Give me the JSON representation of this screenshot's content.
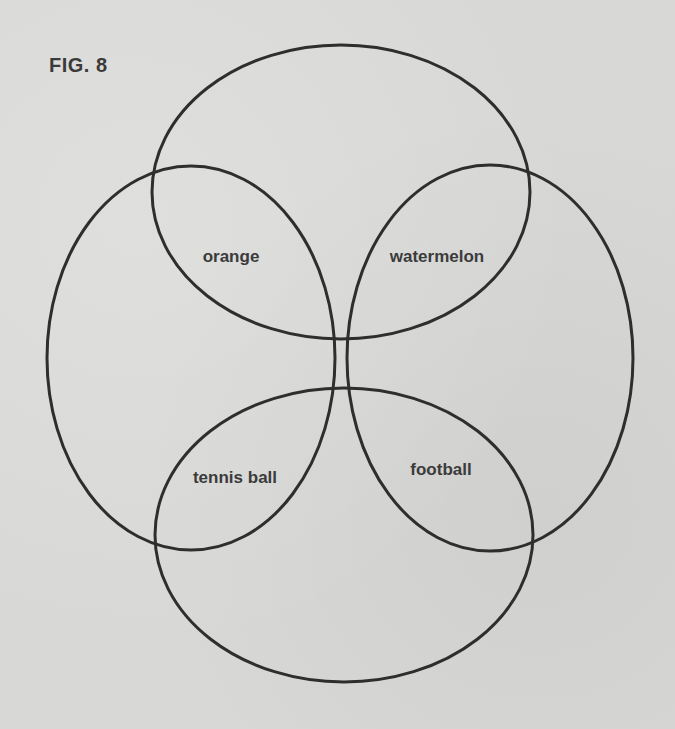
{
  "figure": {
    "title": "FIG. 8",
    "stroke_color": "#2e2e2e",
    "background_color": "#d8d8d6",
    "text_color": "#3b3b3b"
  },
  "ellipses": [
    {
      "name": "top",
      "cx": 341,
      "cy": 192,
      "rx": 189,
      "ry": 147
    },
    {
      "name": "left",
      "cx": 191,
      "cy": 358,
      "rx": 144,
      "ry": 192
    },
    {
      "name": "right",
      "cx": 490,
      "cy": 358,
      "rx": 143,
      "ry": 193
    },
    {
      "name": "bottom",
      "cx": 344,
      "cy": 535,
      "rx": 189,
      "ry": 147
    }
  ],
  "labels": {
    "orange": "orange",
    "watermelon": "watermelon",
    "tennis_ball": "tennis ball",
    "football": "football"
  }
}
